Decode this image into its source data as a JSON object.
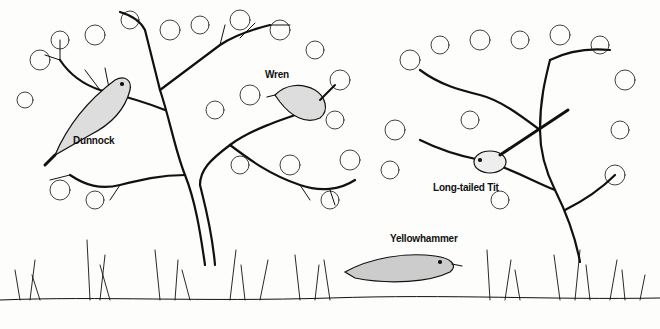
{
  "illustration": {
    "style": "black ink line drawing of hedgerow birds",
    "birds": [
      {
        "name": "Dunnock",
        "label_x": 73,
        "label_y": 135
      },
      {
        "name": "Wren",
        "label_x": 265,
        "label_y": 69
      },
      {
        "name": "Long-tailed Tit",
        "label_x": 433,
        "label_y": 182
      },
      {
        "name": "Yellowhammer",
        "label_x": 390,
        "label_y": 233
      }
    ]
  }
}
